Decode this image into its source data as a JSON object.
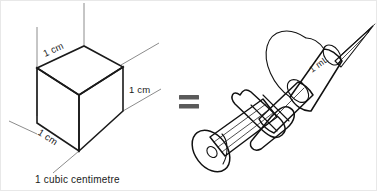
{
  "figure": {
    "background_color": "#ffffff",
    "border_color": "#e8e8e8"
  },
  "cube": {
    "name": "isometric-unit-cube",
    "caption": "1 cubic centimetre",
    "edge_labels": {
      "top": "1 cm",
      "right": "1 cm",
      "front_bottom": "1 cm"
    },
    "colors": {
      "shaded_face": "#b3b3b3",
      "top_face": "#ffffff",
      "left_face": "#ffffff",
      "edge_stroke": "#1a1a1a",
      "axis_stroke": "#8c8c8c"
    }
  },
  "equals": {
    "name": "equals-sign",
    "symbol": "=",
    "color": "#5a5a5a"
  },
  "syringe": {
    "name": "syringe-1ml",
    "volume_label": "1 mL",
    "parts": [
      "needle",
      "needle-hub",
      "barrel",
      "graduation-collar",
      "finger-flange",
      "plunger-rod",
      "thumb-press"
    ],
    "colors": {
      "barrel_fill": "#c9c9c9",
      "body_fill": "#ffffff",
      "outline": "#111111"
    }
  }
}
